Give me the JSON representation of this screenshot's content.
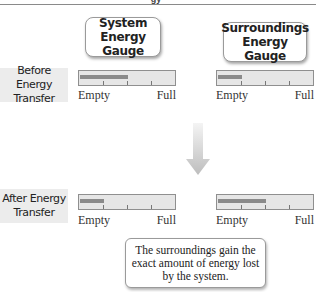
{
  "title_fragment": "gy",
  "columns": [
    {
      "label": "System Energy Gauge"
    },
    {
      "label": "Surroundings Energy Gauge"
    }
  ],
  "rows": [
    {
      "label": "Before Energy Transfer"
    },
    {
      "label": "After Energy Transfer"
    }
  ],
  "gauge_scale": {
    "min_label": "Empty",
    "max_label": "Full",
    "ticks_percent": [
      25,
      50,
      75
    ]
  },
  "gauges": {
    "before": {
      "system_percent": 50,
      "surroundings_percent": 25
    },
    "after": {
      "system_percent": 25,
      "surroundings_percent": 50
    }
  },
  "arrow": {
    "direction": "down",
    "icon": "down-arrow-icon"
  },
  "note": "The surroundings gain the exact amount of energy lost by the system.",
  "colors": {
    "fill": "#8a8a8a",
    "gauge_bg": "#e6e6e6",
    "label_bg": "#ececec",
    "arrow": "#c8c8c8"
  }
}
